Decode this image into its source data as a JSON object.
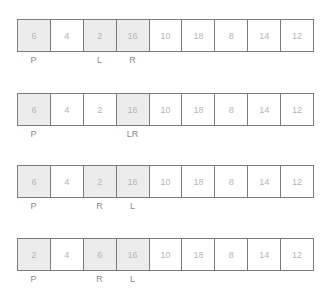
{
  "steps": [
    {
      "cells": [
        {
          "value": "6",
          "highlight": true
        },
        {
          "value": "4",
          "highlight": false
        },
        {
          "value": "2",
          "highlight": true
        },
        {
          "value": "16",
          "highlight": true
        },
        {
          "value": "10",
          "highlight": false
        },
        {
          "value": "18",
          "highlight": false
        },
        {
          "value": "8",
          "highlight": false
        },
        {
          "value": "14",
          "highlight": false
        },
        {
          "value": "12",
          "highlight": false
        }
      ],
      "labels": [
        {
          "index": 0,
          "text": "P"
        },
        {
          "index": 2,
          "text": "L"
        },
        {
          "index": 3,
          "text": "R"
        }
      ]
    },
    {
      "cells": [
        {
          "value": "6",
          "highlight": true
        },
        {
          "value": "4",
          "highlight": false
        },
        {
          "value": "2",
          "highlight": false
        },
        {
          "value": "16",
          "highlight": true
        },
        {
          "value": "10",
          "highlight": false
        },
        {
          "value": "18",
          "highlight": false
        },
        {
          "value": "8",
          "highlight": false
        },
        {
          "value": "14",
          "highlight": false
        },
        {
          "value": "12",
          "highlight": false
        }
      ],
      "labels": [
        {
          "index": 0,
          "text": "P"
        },
        {
          "index": 3,
          "text": "LR"
        }
      ]
    },
    {
      "cells": [
        {
          "value": "6",
          "highlight": true
        },
        {
          "value": "4",
          "highlight": false
        },
        {
          "value": "2",
          "highlight": true
        },
        {
          "value": "16",
          "highlight": true
        },
        {
          "value": "10",
          "highlight": false
        },
        {
          "value": "18",
          "highlight": false
        },
        {
          "value": "8",
          "highlight": false
        },
        {
          "value": "14",
          "highlight": false
        },
        {
          "value": "12",
          "highlight": false
        }
      ],
      "labels": [
        {
          "index": 0,
          "text": "P"
        },
        {
          "index": 2,
          "text": "R"
        },
        {
          "index": 3,
          "text": "L"
        }
      ]
    },
    {
      "cells": [
        {
          "value": "2",
          "highlight": true
        },
        {
          "value": "4",
          "highlight": false
        },
        {
          "value": "6",
          "highlight": true
        },
        {
          "value": "16",
          "highlight": true
        },
        {
          "value": "10",
          "highlight": false
        },
        {
          "value": "18",
          "highlight": false
        },
        {
          "value": "8",
          "highlight": false
        },
        {
          "value": "14",
          "highlight": false
        },
        {
          "value": "12",
          "highlight": false
        }
      ],
      "labels": [
        {
          "index": 0,
          "text": "P"
        },
        {
          "index": 2,
          "text": "R"
        },
        {
          "index": 3,
          "text": "L"
        }
      ]
    }
  ],
  "colors": {
    "highlight_fill": "#ececec",
    "border": "#7a7a7a",
    "cell_text": "#b4b4b4",
    "label_text": "#8a8a8a"
  }
}
